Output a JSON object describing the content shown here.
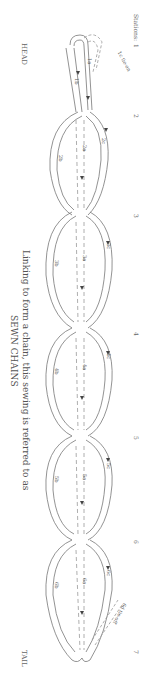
{
  "diagram": {
    "end_labels": {
      "head": "HEAD",
      "tail": "TAIL"
    },
    "stations_label": "Stations:",
    "stations": [
      {
        "label": "1",
        "y": 44
      },
      {
        "label": "2",
        "y": 114
      },
      {
        "label": "3",
        "y": 214
      },
      {
        "label": "4",
        "y": 332
      },
      {
        "label": "5",
        "y": 436
      },
      {
        "label": "6",
        "y": 540
      },
      {
        "label": "7",
        "y": 650
      }
    ],
    "caption": {
      "line1": "Linking to form a chain, this sewing is referred to as",
      "line2": "SEWN CHAINS"
    },
    "tie_on": "1c tie-on",
    "tie_off": "6d tie-off",
    "strand_labels": [
      {
        "text": "1a",
        "x": 88,
        "y": 62
      },
      {
        "text": "1b",
        "x": 75,
        "y": 80
      },
      {
        "text": "2a",
        "x": 83,
        "y": 145
      },
      {
        "text": "2b",
        "x": 58,
        "y": 158
      },
      {
        "text": "2c",
        "x": 101,
        "y": 140
      },
      {
        "text": "3a",
        "x": 83,
        "y": 255
      },
      {
        "text": "3b",
        "x": 54,
        "y": 262
      },
      {
        "text": "3c",
        "x": 106,
        "y": 245
      },
      {
        "text": "4a",
        "x": 83,
        "y": 364
      },
      {
        "text": "4b",
        "x": 54,
        "y": 370
      },
      {
        "text": "4c",
        "x": 106,
        "y": 355
      },
      {
        "text": "5a",
        "x": 83,
        "y": 474
      },
      {
        "text": "5b",
        "x": 54,
        "y": 478
      },
      {
        "text": "5c",
        "x": 106,
        "y": 465
      },
      {
        "text": "6a",
        "x": 83,
        "y": 578
      },
      {
        "text": "6b",
        "x": 54,
        "y": 584
      },
      {
        "text": "6c",
        "x": 106,
        "y": 572
      }
    ],
    "colors": {
      "line": "#777777",
      "dashed": "#999999",
      "text": "#555555"
    }
  }
}
